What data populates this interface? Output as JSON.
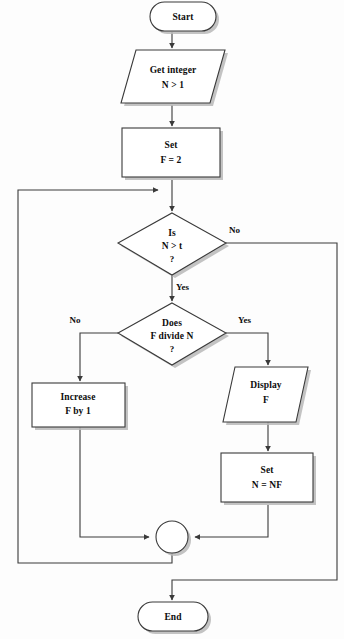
{
  "diagram": {
    "colors": {
      "background": "#fdfdfd",
      "shape_fill": "#ffffff",
      "stroke": "#3a3a3a",
      "shadow": "#b8b8b8",
      "text": "#0d0d0d"
    }
  },
  "nodes": {
    "start": {
      "label": "Start",
      "shape": "terminator"
    },
    "get_integer": {
      "line1": "Get integer",
      "line2": "N > 1",
      "shape": "parallelogram"
    },
    "set_f": {
      "line1": "Set",
      "line2": "F = 2",
      "shape": "process"
    },
    "decision_n_gt_t": {
      "line1": "Is",
      "line2": "N > t",
      "line3": "?",
      "shape": "decision"
    },
    "decision_f_divides_n": {
      "line1": "Does",
      "line2": "F divide N",
      "line3": "?",
      "shape": "decision"
    },
    "increase_f": {
      "line1": "Increase",
      "line2": "F by 1",
      "shape": "process"
    },
    "display_f": {
      "line1": "Display",
      "line2": "F",
      "shape": "parallelogram"
    },
    "set_n": {
      "line1": "Set",
      "line2": "N = NF",
      "shape": "process"
    },
    "connector": {
      "label": "",
      "shape": "connector-circle"
    },
    "end": {
      "label": "End",
      "shape": "terminator"
    }
  },
  "edge_labels": {
    "n_gt_t_no": "No",
    "n_gt_t_yes": "Yes",
    "f_divides_no": "No",
    "f_divides_yes": "Yes"
  }
}
